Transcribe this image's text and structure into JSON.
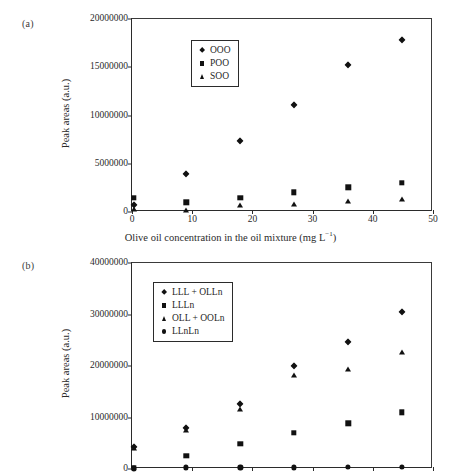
{
  "figure": {
    "panel_a_label": "(a)",
    "panel_b_label": "(b)"
  },
  "chart_data": [
    {
      "type": "scatter",
      "panel": "(a)",
      "title": "",
      "xlabel": "Olive oil concentration in the oil mixture (mg L⁻¹)",
      "ylabel": "Peak areas (a.u.)",
      "xlim": [
        0,
        50
      ],
      "ylim": [
        0,
        20000000
      ],
      "xticks": [
        0,
        10,
        20,
        30,
        40,
        50
      ],
      "xtick_labels": [
        "0",
        "10",
        "20",
        "30",
        "40",
        "50"
      ],
      "yticks": [
        0,
        5000000,
        10000000,
        15000000,
        20000000
      ],
      "ytick_labels": [
        "0",
        "5000000",
        "10000000",
        "15000000",
        "20000000"
      ],
      "grid": false,
      "legend_position": "upper-left-inside",
      "series": [
        {
          "name": "OOO",
          "marker": "diamond",
          "x": [
            0.3,
            9.0,
            18.0,
            26.9,
            35.9,
            44.8
          ],
          "y": [
            700000,
            3900000,
            7350000,
            11050000,
            15200000,
            17800000
          ]
        },
        {
          "name": "POO",
          "marker": "square",
          "x": [
            0.3,
            9.0,
            18.0,
            26.9,
            35.9,
            44.8
          ],
          "y": [
            1500000,
            1000000,
            1500000,
            2050000,
            2550000,
            3050000
          ]
        },
        {
          "name": "SOO",
          "marker": "triangle",
          "x": [
            0.3,
            9.0,
            18.0,
            26.9,
            35.9,
            44.8
          ],
          "y": [
            300000,
            200000,
            700000,
            850000,
            1150000,
            1300000
          ]
        }
      ]
    },
    {
      "type": "scatter",
      "panel": "(b)",
      "title": "",
      "xlabel": "",
      "ylabel": "Peak areas (a.u.)",
      "xlim": [
        0,
        50
      ],
      "ylim": [
        0,
        40000000
      ],
      "xticks": [
        0,
        10,
        20,
        30,
        40,
        50
      ],
      "xtick_labels": [
        "",
        "",
        "",
        "",
        "",
        ""
      ],
      "yticks": [
        0,
        10000000,
        20000000,
        30000000,
        40000000
      ],
      "ytick_labels": [
        "0",
        "10000000",
        "20000000",
        "30000000",
        "40000000"
      ],
      "grid": false,
      "legend_position": "upper-left-inside",
      "series": [
        {
          "name": "LLL + OLLn",
          "marker": "diamond",
          "x": [
            0.3,
            9.0,
            18.0,
            26.9,
            35.9,
            44.8
          ],
          "y": [
            4200000,
            7900000,
            12600000,
            20000000,
            24600000,
            30400000
          ]
        },
        {
          "name": "LLLn",
          "marker": "square",
          "x": [
            0.3,
            9.0,
            18.0,
            26.9,
            35.9,
            44.8
          ],
          "y": [
            200000,
            2600000,
            4900000,
            7000000,
            8900000,
            11000000
          ]
        },
        {
          "name": "OLL + OOLn",
          "marker": "triangle",
          "x": [
            0.3,
            9.0,
            18.0,
            26.9,
            35.9,
            44.8
          ],
          "y": [
            4000000,
            7500000,
            11700000,
            18300000,
            19500000,
            22700000
          ]
        },
        {
          "name": "LLnLn",
          "marker": "circle",
          "x": [
            0.3,
            9.0,
            18.0,
            26.9,
            35.9,
            44.8
          ],
          "y": [
            100000,
            300000,
            300000,
            300000,
            350000,
            400000
          ]
        }
      ]
    }
  ]
}
